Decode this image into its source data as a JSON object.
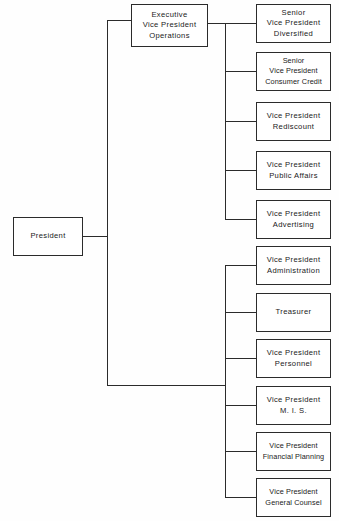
{
  "chart": {
    "type": "org-chart",
    "orientation": "left-to-right",
    "background_color": "#fefefe",
    "line_color": "#2b2b2b",
    "box_fill": "#ffffff",
    "root": {
      "id": "president",
      "label": "President",
      "lines": [
        "President"
      ]
    },
    "executive": {
      "id": "evp-operations",
      "label": "Executive Vice President Operations",
      "lines": [
        "Executive",
        "Vice President",
        "Operations"
      ]
    },
    "groups": [
      {
        "id": "operations-group",
        "reports_to": "evp-operations",
        "nodes": [
          {
            "id": "svp-diversified",
            "label": "Senior Vice President Diversified",
            "lines": [
              "Senior",
              "Vice President",
              "Diversified"
            ]
          },
          {
            "id": "svp-consumer-credit",
            "label": "Senior Vice President Consumer Credit",
            "lines": [
              "Senior",
              "Vice President",
              "Consumer Credit"
            ]
          },
          {
            "id": "vp-rediscount",
            "label": "Vice President Rediscount",
            "lines": [
              "Vice President",
              "Rediscount"
            ]
          },
          {
            "id": "vp-public-affairs",
            "label": "Vice President Public Affairs",
            "lines": [
              "Vice President",
              "Public Affairs"
            ]
          },
          {
            "id": "vp-advertising",
            "label": "Vice President Advertising",
            "lines": [
              "Vice President",
              "Advertising"
            ]
          }
        ]
      },
      {
        "id": "staff-group",
        "reports_to": "president",
        "nodes": [
          {
            "id": "vp-administration",
            "label": "Vice President Administration",
            "lines": [
              "Vice President",
              "Administration"
            ]
          },
          {
            "id": "treasurer",
            "label": "Treasurer",
            "lines": [
              "Treasurer"
            ]
          },
          {
            "id": "vp-personnel",
            "label": "Vice President Personnel",
            "lines": [
              "Vice President",
              "Personnel"
            ]
          },
          {
            "id": "vp-mis",
            "label": "Vice President M. I. S.",
            "lines": [
              "Vice President",
              "M. I. S."
            ]
          },
          {
            "id": "vp-financial-planning",
            "label": "Vice President Financial Planning",
            "lines": [
              "Vice President",
              "Financial Planning"
            ]
          },
          {
            "id": "vp-general-counsel",
            "label": "Vice President General Counsel",
            "lines": [
              "Vice President",
              "General Counsel"
            ]
          }
        ]
      }
    ]
  }
}
